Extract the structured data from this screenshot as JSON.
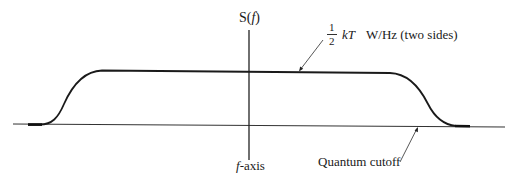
{
  "diagram": {
    "type": "noise power spectral density",
    "y_axis_label": {
      "prefix": "S(",
      "var": "f",
      "suffix": ")"
    },
    "x_axis_label": {
      "var": "f",
      "suffix": "-axis"
    },
    "level_label": {
      "frac_num": "1",
      "frac_den": "2",
      "kT": "kT",
      "units": "W/Hz (two sides)"
    },
    "cutoff_label": "Quantum cutoff",
    "colors": {
      "curve": "#1a1a1a",
      "axis": "#333333",
      "text": "#1a1a1a"
    }
  }
}
